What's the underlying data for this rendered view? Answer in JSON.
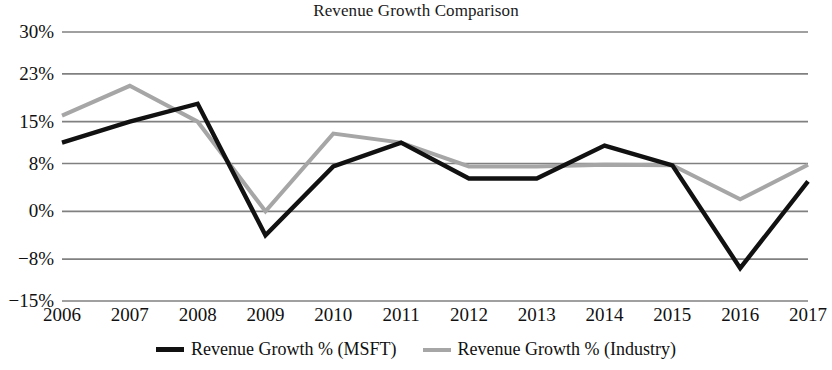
{
  "chart_data": {
    "type": "line",
    "title": "Revenue Growth Comparison",
    "xlabel": "",
    "ylabel": "",
    "x": [
      "2006",
      "2007",
      "2008",
      "2009",
      "2010",
      "2011",
      "2012",
      "2013",
      "2014",
      "2015",
      "2016",
      "2017"
    ],
    "categories": [
      "2006",
      "2007",
      "2008",
      "2009",
      "2010",
      "2011",
      "2012",
      "2013",
      "2014",
      "2015",
      "2016",
      "2017"
    ],
    "series": [
      {
        "name": "Revenue Growth % (MSFT)",
        "color": "#111111",
        "values": [
          11.5,
          15.0,
          18.0,
          -4.0,
          7.5,
          11.5,
          5.5,
          5.5,
          11.0,
          7.7,
          -9.5,
          5.0
        ]
      },
      {
        "name": "Revenue Growth % (Industry)",
        "color": "#a6a6a6",
        "values": [
          16.0,
          21.0,
          15.0,
          0.0,
          13.0,
          11.5,
          7.5,
          7.5,
          7.8,
          7.7,
          2.0,
          7.8
        ]
      }
    ],
    "ylim": [
      -15,
      30
    ],
    "yticks": [
      30,
      23,
      15,
      8,
      0,
      -8,
      -15
    ],
    "ytick_labels": [
      "30%",
      "23%",
      "15%",
      "8%",
      "0%",
      "−8%",
      "−15%"
    ],
    "grid": true,
    "grid_color": "#808080",
    "legend_position": "bottom",
    "legend": [
      {
        "label": "Revenue Growth % (MSFT)",
        "color": "#111111",
        "weight": "thick"
      },
      {
        "label": "Revenue Growth % (Industry)",
        "color": "#a6a6a6",
        "weight": "thin"
      }
    ]
  }
}
